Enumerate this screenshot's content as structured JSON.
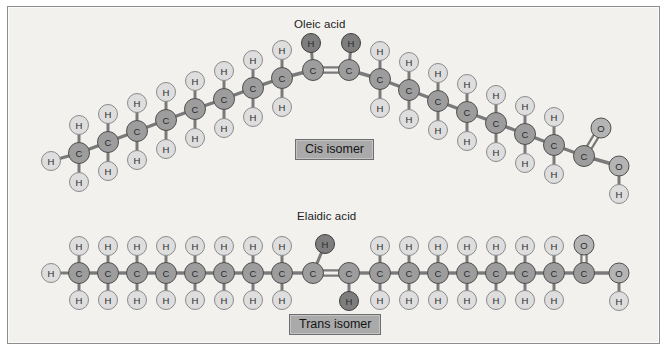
{
  "figure": {
    "background_color": "#f2f1ee",
    "border_color": "#8d8d8d",
    "width": 667,
    "height": 351
  },
  "palette": {
    "carbon_fill": "#9d9d9d",
    "carbon_stroke": "#4f4f4f",
    "hydrogen_fill": "#dedede",
    "hydrogen_stroke": "#8a8a8a",
    "oxygen_fill": "#b4b4b4",
    "oxygen_stroke": "#4f4f4f",
    "highlight_fill": "#7e7e7e",
    "highlight_stroke": "#3d3d3d",
    "bond_color": "#7a7a7a",
    "label_color": "#2b2b2b",
    "box_fill": "#aaaaaa",
    "box_border": "#6e6e6e"
  },
  "molecules": [
    {
      "id": "oleic-acid",
      "title": "Oleic acid",
      "title_x": 293,
      "title_y": 17,
      "isomer_label": "Cis isomer",
      "isomer_box_x": 294,
      "isomer_box_y": 138,
      "geometry_note": "bent chain, cis double bond at apex with both hydrogens on the upper side",
      "double_bond": {
        "c_left_index": 8,
        "c_right_index": 9
      },
      "formula": "C18H34O2",
      "carbons": [
        {
          "i": 0,
          "x": 78,
          "y": 152,
          "h_up": {
            "x": 78,
            "y": 124
          },
          "h_down": {
            "x": 78,
            "y": 181
          },
          "h_left": {
            "x": 50,
            "y": 160
          }
        },
        {
          "i": 1,
          "x": 107,
          "y": 141,
          "h_up": {
            "x": 107,
            "y": 113
          },
          "h_down": {
            "x": 107,
            "y": 170
          }
        },
        {
          "i": 2,
          "x": 136,
          "y": 130,
          "h_up": {
            "x": 136,
            "y": 102
          },
          "h_down": {
            "x": 136,
            "y": 159
          }
        },
        {
          "i": 3,
          "x": 165,
          "y": 119,
          "h_up": {
            "x": 165,
            "y": 91
          },
          "h_down": {
            "x": 165,
            "y": 148
          }
        },
        {
          "i": 4,
          "x": 194,
          "y": 108,
          "h_up": {
            "x": 194,
            "y": 80
          },
          "h_down": {
            "x": 194,
            "y": 137
          }
        },
        {
          "i": 5,
          "x": 223,
          "y": 98,
          "h_up": {
            "x": 223,
            "y": 70
          },
          "h_down": {
            "x": 223,
            "y": 127
          }
        },
        {
          "i": 6,
          "x": 252,
          "y": 87,
          "h_up": {
            "x": 252,
            "y": 59
          },
          "h_down": {
            "x": 252,
            "y": 116
          }
        },
        {
          "i": 7,
          "x": 281,
          "y": 77,
          "h_up": {
            "x": 281,
            "y": 49
          },
          "h_down": {
            "x": 281,
            "y": 106
          }
        },
        {
          "i": 8,
          "x": 312,
          "y": 69,
          "h_up": {
            "x": 310,
            "y": 42
          },
          "highlight_up": true
        },
        {
          "i": 9,
          "x": 348,
          "y": 69,
          "h_up": {
            "x": 350,
            "y": 42
          },
          "highlight_up": true
        },
        {
          "i": 10,
          "x": 379,
          "y": 78,
          "h_up": {
            "x": 379,
            "y": 50
          },
          "h_down": {
            "x": 379,
            "y": 107
          }
        },
        {
          "i": 11,
          "x": 408,
          "y": 89,
          "h_up": {
            "x": 408,
            "y": 61
          },
          "h_down": {
            "x": 408,
            "y": 118
          }
        },
        {
          "i": 12,
          "x": 437,
          "y": 100,
          "h_up": {
            "x": 437,
            "y": 72
          },
          "h_down": {
            "x": 437,
            "y": 129
          }
        },
        {
          "i": 13,
          "x": 466,
          "y": 111,
          "h_up": {
            "x": 466,
            "y": 83
          },
          "h_down": {
            "x": 466,
            "y": 140
          }
        },
        {
          "i": 14,
          "x": 495,
          "y": 122,
          "h_up": {
            "x": 495,
            "y": 94
          },
          "h_down": {
            "x": 495,
            "y": 151
          }
        },
        {
          "i": 15,
          "x": 524,
          "y": 133,
          "h_up": {
            "x": 524,
            "y": 105
          },
          "h_down": {
            "x": 524,
            "y": 162
          }
        },
        {
          "i": 16,
          "x": 553,
          "y": 144,
          "h_up": {
            "x": 553,
            "y": 116
          },
          "h_down": {
            "x": 553,
            "y": 173
          }
        },
        {
          "i": 17,
          "x": 583,
          "y": 155,
          "carboxyl": true
        }
      ],
      "carboxyl": {
        "o_double": {
          "x": 600,
          "y": 127
        },
        "o_single": {
          "x": 618,
          "y": 165
        },
        "h_hydroxyl": {
          "x": 618,
          "y": 193
        }
      }
    },
    {
      "id": "elaidic-acid",
      "title": "Elaidic acid",
      "title_x": 296,
      "title_y": 209,
      "isomer_label": "Trans isomer",
      "isomer_box_x": 288,
      "isomer_box_y": 313,
      "geometry_note": "straight chain, trans double bond with hydrogens on opposite sides",
      "double_bond": {
        "c_left_index": 8,
        "c_right_index": 9
      },
      "formula": "C18H34O2",
      "carbons": [
        {
          "i": 0,
          "x": 78,
          "y": 272,
          "h_up": {
            "x": 78,
            "y": 245
          },
          "h_down": {
            "x": 78,
            "y": 299
          },
          "h_left": {
            "x": 50,
            "y": 272
          }
        },
        {
          "i": 1,
          "x": 107,
          "y": 272,
          "h_up": {
            "x": 107,
            "y": 245
          },
          "h_down": {
            "x": 107,
            "y": 299
          }
        },
        {
          "i": 2,
          "x": 136,
          "y": 272,
          "h_up": {
            "x": 136,
            "y": 245
          },
          "h_down": {
            "x": 136,
            "y": 299
          }
        },
        {
          "i": 3,
          "x": 165,
          "y": 272,
          "h_up": {
            "x": 165,
            "y": 245
          },
          "h_down": {
            "x": 165,
            "y": 299
          }
        },
        {
          "i": 4,
          "x": 194,
          "y": 272,
          "h_up": {
            "x": 194,
            "y": 245
          },
          "h_down": {
            "x": 194,
            "y": 299
          }
        },
        {
          "i": 5,
          "x": 223,
          "y": 272,
          "h_up": {
            "x": 223,
            "y": 245
          },
          "h_down": {
            "x": 223,
            "y": 299
          }
        },
        {
          "i": 6,
          "x": 252,
          "y": 272,
          "h_up": {
            "x": 252,
            "y": 245
          },
          "h_down": {
            "x": 252,
            "y": 299
          }
        },
        {
          "i": 7,
          "x": 281,
          "y": 272,
          "h_up": {
            "x": 281,
            "y": 245
          },
          "h_down": {
            "x": 281,
            "y": 299
          }
        },
        {
          "i": 8,
          "x": 312,
          "y": 272,
          "h_up": {
            "x": 324,
            "y": 243
          },
          "highlight_up": true
        },
        {
          "i": 9,
          "x": 348,
          "y": 272,
          "h_down": {
            "x": 348,
            "y": 300
          },
          "highlight_down": true
        },
        {
          "i": 10,
          "x": 379,
          "y": 272,
          "h_up": {
            "x": 379,
            "y": 245
          },
          "h_down": {
            "x": 379,
            "y": 299
          }
        },
        {
          "i": 11,
          "x": 408,
          "y": 272,
          "h_up": {
            "x": 408,
            "y": 245
          },
          "h_down": {
            "x": 408,
            "y": 299
          }
        },
        {
          "i": 12,
          "x": 437,
          "y": 272,
          "h_up": {
            "x": 437,
            "y": 245
          },
          "h_down": {
            "x": 437,
            "y": 299
          }
        },
        {
          "i": 13,
          "x": 466,
          "y": 272,
          "h_up": {
            "x": 466,
            "y": 245
          },
          "h_down": {
            "x": 466,
            "y": 299
          }
        },
        {
          "i": 14,
          "x": 495,
          "y": 272,
          "h_up": {
            "x": 495,
            "y": 245
          },
          "h_down": {
            "x": 495,
            "y": 299
          }
        },
        {
          "i": 15,
          "x": 524,
          "y": 272,
          "h_up": {
            "x": 524,
            "y": 245
          },
          "h_down": {
            "x": 524,
            "y": 299
          }
        },
        {
          "i": 16,
          "x": 553,
          "y": 272,
          "h_up": {
            "x": 553,
            "y": 245
          },
          "h_down": {
            "x": 553,
            "y": 299
          }
        },
        {
          "i": 17,
          "x": 583,
          "y": 272,
          "carboxyl": true
        }
      ],
      "carboxyl": {
        "o_double": {
          "x": 583,
          "y": 244
        },
        "o_single": {
          "x": 618,
          "y": 272
        },
        "h_hydroxyl": {
          "x": 618,
          "y": 300
        }
      }
    }
  ],
  "atom_symbols": {
    "carbon": "C",
    "hydrogen": "H",
    "oxygen": "O"
  },
  "radii": {
    "carbon": 10.5,
    "hydrogen": 9.5,
    "oxygen": 10.0
  }
}
